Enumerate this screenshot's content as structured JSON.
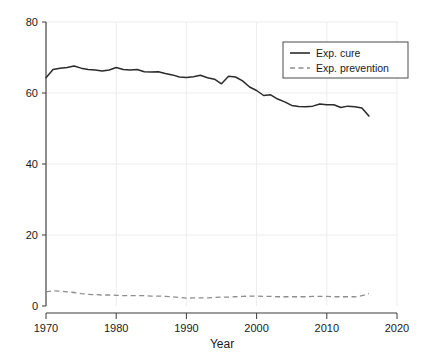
{
  "chart_data": {
    "type": "line",
    "title": "",
    "xlabel": "Year",
    "ylabel": "",
    "xlim": [
      1970,
      2020
    ],
    "ylim": [
      0,
      80
    ],
    "grid": true,
    "legend_position": "upper right",
    "xticks": [
      1970,
      1980,
      1990,
      2000,
      2010,
      2020
    ],
    "yticks": [
      0,
      20,
      40,
      60,
      80
    ],
    "xtick_labels": [
      "1970",
      "1980",
      "1990",
      "2000",
      "2010",
      "2020"
    ],
    "ytick_labels": [
      "0",
      "20",
      "40",
      "60",
      "80"
    ],
    "x": [
      1970,
      1971,
      1972,
      1973,
      1974,
      1975,
      1976,
      1977,
      1978,
      1979,
      1980,
      1981,
      1982,
      1983,
      1984,
      1985,
      1986,
      1987,
      1988,
      1989,
      1990,
      1991,
      1992,
      1993,
      1994,
      1995,
      1996,
      1997,
      1998,
      1999,
      2000,
      2001,
      2002,
      2003,
      2004,
      2005,
      2006,
      2007,
      2008,
      2009,
      2010,
      2011,
      2012,
      2013,
      2014,
      2015,
      2016
    ],
    "series": [
      {
        "name": "Exp. cure",
        "style": "solid",
        "color": "#2a2a2a",
        "values": [
          64.3,
          66.6,
          67.0,
          67.2,
          67.6,
          67.0,
          66.6,
          66.5,
          66.2,
          66.5,
          67.2,
          66.6,
          66.5,
          66.6,
          66.0,
          65.9,
          66.0,
          65.5,
          65.1,
          64.5,
          64.4,
          64.6,
          65.0,
          64.3,
          63.9,
          62.6,
          64.7,
          64.5,
          63.4,
          61.7,
          60.7,
          59.3,
          59.5,
          58.3,
          57.5,
          56.5,
          56.2,
          56.1,
          56.3,
          56.9,
          56.7,
          56.7,
          55.9,
          56.3,
          56.1,
          55.8,
          53.5
        ]
      },
      {
        "name": "Exp. prevention",
        "style": "dashed",
        "color": "#8d8d8d",
        "values": [
          4.0,
          4.3,
          4.2,
          4.0,
          3.8,
          3.5,
          3.3,
          3.2,
          3.1,
          3.1,
          3.0,
          2.9,
          2.9,
          2.9,
          2.9,
          2.8,
          2.8,
          2.7,
          2.6,
          2.4,
          2.2,
          2.3,
          2.3,
          2.3,
          2.4,
          2.5,
          2.5,
          2.6,
          2.7,
          2.8,
          2.8,
          2.7,
          2.7,
          2.6,
          2.6,
          2.6,
          2.6,
          2.6,
          2.7,
          2.7,
          2.7,
          2.6,
          2.6,
          2.6,
          2.6,
          2.9,
          3.5
        ]
      }
    ]
  },
  "legend": {
    "entries": [
      {
        "label": "Exp. cure"
      },
      {
        "label": "Exp. prevention"
      }
    ]
  }
}
